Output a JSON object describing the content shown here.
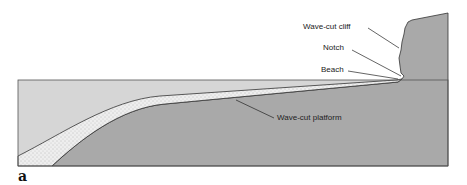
{
  "diagram": {
    "panel_label": "a",
    "labels": {
      "wave_cut_cliff": "Wave-cut cliff",
      "notch": "Notch",
      "beach": "Beach",
      "wave_cut_platform": "Wave-cut platform"
    },
    "colors": {
      "water": "#d6d6d6",
      "rock": "#a9a9a9",
      "sediment": "#ececec",
      "outline": "#333333"
    }
  }
}
